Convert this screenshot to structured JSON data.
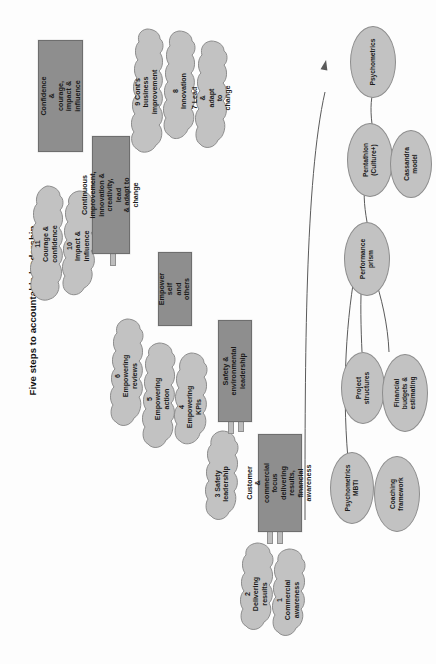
{
  "document": {
    "title": "Five steps to accountable leadership",
    "type": "diagram"
  },
  "colors": {
    "background": "#fdfdfd",
    "step_box_fill": "#8e8e8e",
    "step_box_stroke": "#6e6e6e",
    "cloud_fill": "#c2c2c2",
    "cloud_stroke": "#8d8d8d",
    "ellipse_fill": "#c2c2c2",
    "ellipse_stroke": "#8d8d8d",
    "connector": "#5a5a5a",
    "text": "#1a1a1a"
  },
  "steps": [
    {
      "id": "step-customer-commercial",
      "label": "Customer &\ncommercial focus\ndelivering results,\nfinancial awareness"
    },
    {
      "id": "step-safety-environmental",
      "label": "Safety & environmental\nleadership"
    },
    {
      "id": "step-empower",
      "label": "Empower self\nand others"
    },
    {
      "id": "step-continuous-improvement",
      "label": "Continuous improvement,\ninnovation & creativity, lead\n& adapt to change"
    },
    {
      "id": "step-confidence-courage",
      "label": "Confidence &\ncourage,\nimpact & influence"
    }
  ],
  "competencies": [
    {
      "number": "1",
      "id": "cloud-commercial-awareness",
      "label": "1 Commercial\nawareness"
    },
    {
      "number": "2",
      "id": "cloud-delivering-results",
      "label": "2 Delivering\nresults"
    },
    {
      "number": "3",
      "id": "cloud-safety-leadership",
      "label": "3 Safety\nleadership"
    },
    {
      "number": "4",
      "id": "cloud-empowering-kpis",
      "label": "4 Empowering\nKPIs"
    },
    {
      "number": "5",
      "id": "cloud-empowering-action",
      "label": "5 Empowering\naction"
    },
    {
      "number": "6",
      "id": "cloud-empowering-reviews",
      "label": "6 Empowering\nreviews"
    },
    {
      "number": "7",
      "id": "cloud-lead-adapt-change",
      "label": "7 Lead & adapt\nto change"
    },
    {
      "number": "8",
      "id": "cloud-innovation",
      "label": "8 Innovation"
    },
    {
      "number": "9",
      "id": "cloud-continuous-business",
      "label": "9 Cont's business\nimprovement"
    },
    {
      "number": "10",
      "id": "cloud-impact-influence",
      "label": "10 Impact &\ninfluence"
    },
    {
      "number": "11",
      "id": "cloud-courage-confidence",
      "label": "11 Courage &\nconfidence"
    }
  ],
  "tools": [
    {
      "id": "tool-psychometrics",
      "label": "Psychometrics"
    },
    {
      "id": "tool-pentathlon",
      "label": "Pentathlon\n(Culture+)"
    },
    {
      "id": "tool-cassandra-model",
      "label": "Cassandra\nmodel"
    },
    {
      "id": "tool-performance-prism",
      "label": "Performance\nprism"
    },
    {
      "id": "tool-project-structures",
      "label": "Project\nstructures"
    },
    {
      "id": "tool-financial-budgets",
      "label": "Financial\nbudgets &\nestimating"
    },
    {
      "id": "tool-psychometrics-mbti",
      "label": "Psychometrics\nMBTI"
    },
    {
      "id": "tool-coaching-framework",
      "label": "Coaching\nframework"
    }
  ]
}
